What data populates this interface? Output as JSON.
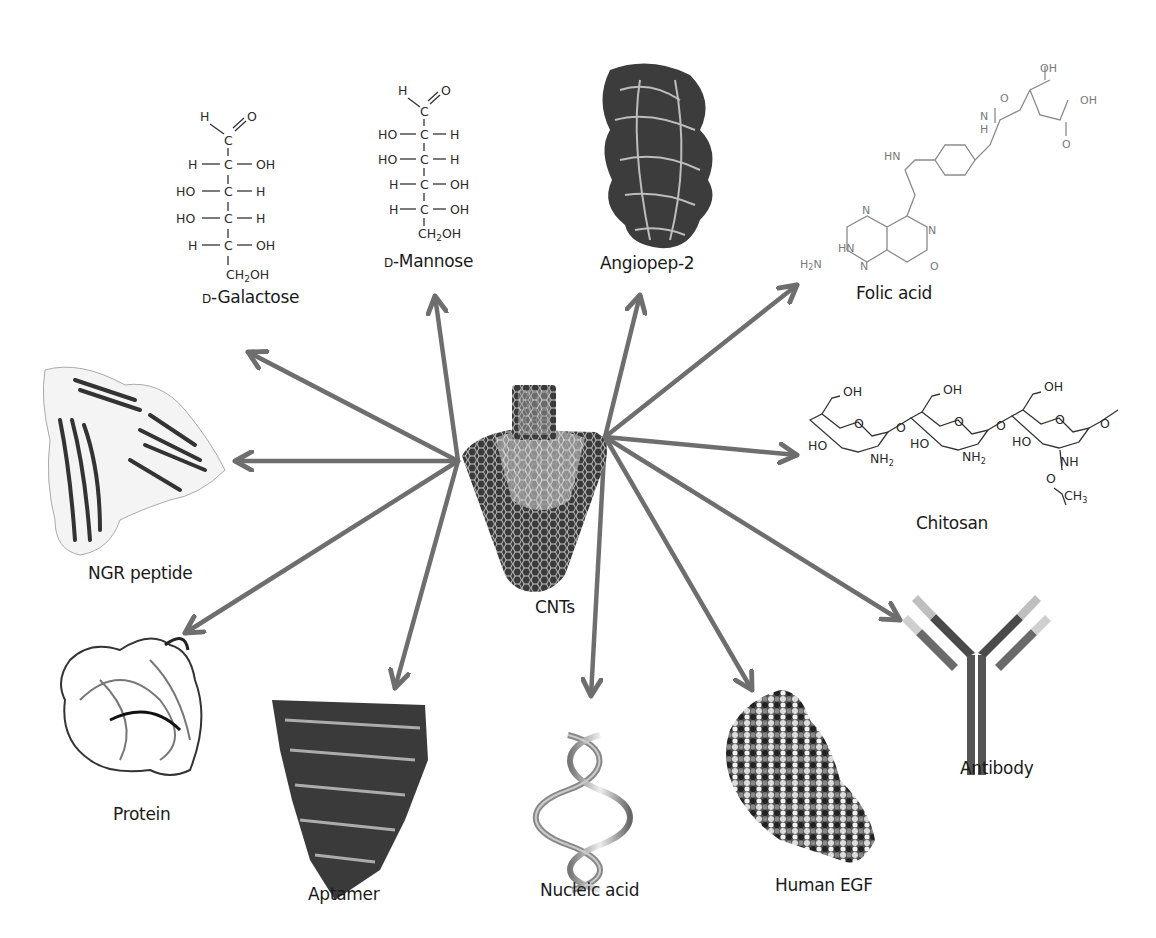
{
  "diagram": {
    "center": {
      "label": "CNTs",
      "icon": "carbon-nanotube-icon"
    },
    "arrow_color": "#6e6e6e",
    "nodes": [
      {
        "id": "d-galactose",
        "prefix": "D",
        "label": "-Galactose",
        "type": "fischer-projection",
        "rows": [
          [
            "H",
            "C",
            "OH"
          ],
          [
            "HO",
            "C",
            "H"
          ],
          [
            "HO",
            "C",
            "H"
          ],
          [
            "H",
            "C",
            "OH"
          ]
        ],
        "top": [
          "H",
          "O"
        ],
        "bottom": "CH2OH"
      },
      {
        "id": "d-mannose",
        "prefix": "D",
        "label": "-Mannose",
        "type": "fischer-projection",
        "rows": [
          [
            "HO",
            "C",
            "H"
          ],
          [
            "HO",
            "C",
            "H"
          ],
          [
            "H",
            "C",
            "OH"
          ],
          [
            "H",
            "C",
            "OH"
          ]
        ],
        "top": [
          "H",
          "O"
        ],
        "bottom": "CH2OH"
      },
      {
        "id": "angiopep-2",
        "label": "Angiopep-2",
        "type": "protein-ribbon"
      },
      {
        "id": "folic-acid",
        "label": "Folic acid",
        "type": "structural-formula",
        "atoms": [
          "OH",
          "O",
          "OH",
          "O",
          "O",
          "N",
          "H",
          "HN",
          "N",
          "N",
          "HN",
          "H2N",
          "N",
          "O"
        ]
      },
      {
        "id": "chitosan",
        "label": "Chitosan",
        "type": "structural-formula",
        "atoms": [
          "OH",
          "OH",
          "OH",
          "O",
          "O",
          "O",
          "O",
          "O",
          "O",
          "HO",
          "HO",
          "HO",
          "NH2",
          "NH2",
          "NH",
          "O",
          "CH3"
        ]
      },
      {
        "id": "ngr-peptide",
        "label": "NGR peptide",
        "type": "protein-ribbon"
      },
      {
        "id": "antibody",
        "label": "Antibody",
        "type": "y-shaped-antibody"
      },
      {
        "id": "protein",
        "label": "Protein",
        "type": "protein-ribbon"
      },
      {
        "id": "aptamer",
        "label": "Aptamer",
        "type": "nucleic-acid-3d"
      },
      {
        "id": "nucleic-acid",
        "label": "Nucleic acid",
        "type": "double-helix"
      },
      {
        "id": "human-egf",
        "label": "Human EGF",
        "type": "space-filling-model"
      }
    ],
    "arrows": [
      {
        "to": "d-galactose",
        "from": [
          458,
          461
        ],
        "tip": [
          248,
          352
        ]
      },
      {
        "to": "d-mannose",
        "from": [
          458,
          461
        ],
        "tip": [
          435,
          296
        ]
      },
      {
        "to": "ngr-peptide",
        "from": [
          458,
          461
        ],
        "tip": [
          235,
          461
        ]
      },
      {
        "to": "protein",
        "from": [
          458,
          461
        ],
        "tip": [
          185,
          633
        ]
      },
      {
        "to": "aptamer",
        "from": [
          458,
          461
        ],
        "tip": [
          395,
          688
        ]
      },
      {
        "to": "angiopep-2",
        "from": [
          605,
          437
        ],
        "tip": [
          640,
          295
        ]
      },
      {
        "to": "folic-acid",
        "from": [
          605,
          437
        ],
        "tip": [
          797,
          285
        ]
      },
      {
        "to": "chitosan",
        "from": [
          605,
          437
        ],
        "tip": [
          797,
          455
        ]
      },
      {
        "to": "antibody",
        "from": [
          605,
          437
        ],
        "tip": [
          900,
          620
        ]
      },
      {
        "to": "nucleic-acid",
        "from": [
          605,
          437
        ],
        "tip": [
          591,
          696
        ]
      },
      {
        "to": "human-egf",
        "from": [
          605,
          437
        ],
        "tip": [
          752,
          690
        ]
      }
    ]
  }
}
